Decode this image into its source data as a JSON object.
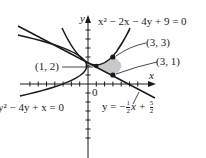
{
  "figure": {
    "type": "graph-of-region-between-curves",
    "axes": {
      "x_label": "x",
      "y_label": "y",
      "origin_label": "0"
    },
    "curves": [
      {
        "id": "parabola-up",
        "equation": "x² − 2x − 4y + 9 = 0",
        "label": "x² − 2x − 4y + 9 = 0"
      },
      {
        "id": "parabola-left",
        "equation": "y² − 4y + x = 0",
        "label": "y² − 4y + x = 0"
      },
      {
        "id": "line",
        "equation": "y = −½x + 5/2",
        "label_prefix": "y = −",
        "label_frac1_num": "1",
        "label_frac1_den": "2",
        "label_mid": "x + ",
        "label_frac2_num": "5",
        "label_frac2_den": "2"
      }
    ],
    "points": [
      {
        "label": "(3, 3)",
        "x": 3,
        "y": 3
      },
      {
        "label": "(3, 1)",
        "x": 3,
        "y": 1
      },
      {
        "label": "(1, 2)",
        "x": 1,
        "y": 2
      }
    ],
    "shaded_region": "bounded by x² − 2x − 4y + 9 = 0 and y² − 4y + x = 0 and line",
    "colors": {
      "ink": "#1a1a1a",
      "shade": "#c8c8cc"
    }
  }
}
